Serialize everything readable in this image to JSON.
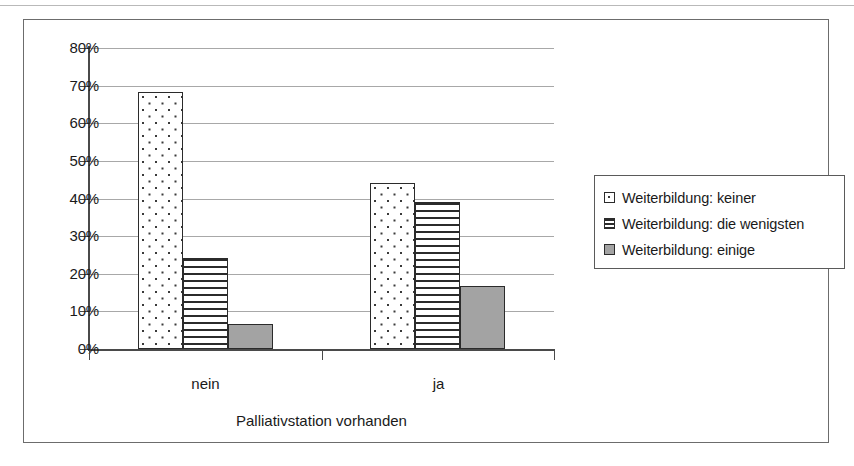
{
  "chart_data": {
    "type": "bar",
    "title": "",
    "subtitle": "",
    "xlabel": "Palliativstation vorhanden",
    "ylabel": "",
    "categories": [
      "nein",
      "ja"
    ],
    "series": [
      {
        "name": "Weiterbildung: keiner",
        "pattern": "dotted",
        "values": [
          68.3,
          44.0
        ]
      },
      {
        "name": "Weiterbildung: die wenigsten",
        "pattern": "horizontal-lines",
        "values": [
          24.2,
          39.0
        ]
      },
      {
        "name": "Weiterbildung: einige",
        "pattern": "solid-gray",
        "values": [
          6.7,
          16.7
        ]
      }
    ],
    "ylim": [
      0,
      80
    ],
    "ytick_values": [
      0,
      10,
      20,
      30,
      40,
      50,
      60,
      70,
      80
    ],
    "ytick_labels": [
      "0%",
      "10%",
      "20%",
      "30%",
      "40%",
      "50%",
      "60%",
      "70%",
      "80%"
    ],
    "yaxis_tick_format": "percent",
    "grid": true,
    "grid_axis": "y",
    "legend_position": "right",
    "colors": {
      "bar_outline": "#2b2b2b",
      "series_3_fill": "#a3a3a3",
      "gridline": "#a8a8a8",
      "axis": "#4a4a4a",
      "frame": "#6c6c6c",
      "text": "#1a1a1a",
      "background": "#ffffff"
    }
  },
  "legend": {
    "items": [
      {
        "label": "Weiterbildung: keiner",
        "swatch": "dotted-swatch-icon"
      },
      {
        "label": "Weiterbildung: die wenigsten",
        "swatch": "hlines-swatch-icon"
      },
      {
        "label": "Weiterbildung: einige",
        "swatch": "solid-gray-swatch-icon"
      }
    ]
  },
  "axes": {
    "y_labels": [
      "80%",
      "70%",
      "60%",
      "50%",
      "40%",
      "30%",
      "20%",
      "10%",
      "0%"
    ],
    "x_categories": [
      "nein",
      "ja"
    ],
    "x_title": "Palliativstation vorhanden"
  }
}
